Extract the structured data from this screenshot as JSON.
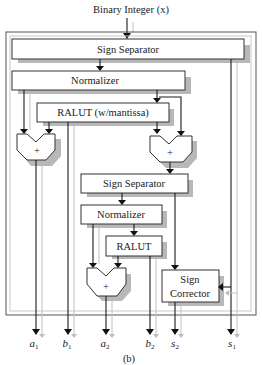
{
  "diagram": {
    "input_label": "Binary Integer (x)",
    "blocks": {
      "sign_separator_1": "Sign Separator",
      "normalizer_1": "Normalizer",
      "ralut_1": "RALUT (w/mantissa)",
      "adder_1": "+",
      "adder_2": "+",
      "sign_separator_2": "Sign Separator",
      "normalizer_2": "Normalizer",
      "ralut_2": "RALUT",
      "adder_3": "+",
      "sign_corrector_line1": "Sign",
      "sign_corrector_line2": "Corrector"
    },
    "outputs": [
      {
        "base": "a",
        "sub": "1"
      },
      {
        "base": "b",
        "sub": "1"
      },
      {
        "base": "a",
        "sub": "2"
      },
      {
        "base": "b",
        "sub": "2"
      },
      {
        "base": "s",
        "sub": "2"
      },
      {
        "base": "s",
        "sub": "1"
      }
    ],
    "caption": "(b)",
    "colors": {
      "line": "#1a1a1a",
      "shadow": "#b8b8b8",
      "gray_line": "#c0c0c0"
    }
  }
}
